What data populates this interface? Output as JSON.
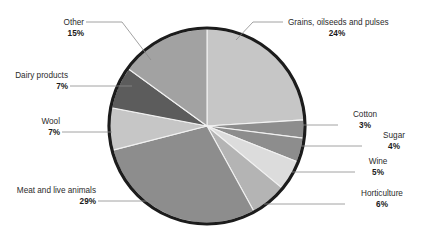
{
  "chart_data": {
    "type": "pie",
    "title": "",
    "subtitle": "",
    "xlabel": "",
    "ylabel": "",
    "legend_position": "none",
    "grid": false,
    "unit": "%",
    "total": 100,
    "start_angle_deg": 0,
    "direction": "clockwise",
    "categories": [
      "Grains, oilseeds and pulses",
      "Cotton",
      "Sugar",
      "Wine",
      "Horticulture",
      "Meat and live animals",
      "Wool",
      "Dairy products",
      "Other"
    ],
    "values": [
      24,
      3,
      4,
      5,
      6,
      29,
      7,
      7,
      15
    ],
    "slices": [
      {
        "label": "Grains, oilseeds and pulses",
        "value": 24,
        "value_text": "24%",
        "color": "#c6c6c6",
        "label_side": "right"
      },
      {
        "label": "Cotton",
        "value": 3,
        "value_text": "3%",
        "color": "#8d8d8d",
        "label_side": "right"
      },
      {
        "label": "Sugar",
        "value": 4,
        "value_text": "4%",
        "color": "#8d8d8d",
        "label_side": "right"
      },
      {
        "label": "Wine",
        "value": 5,
        "value_text": "5%",
        "color": "#dcdcdc",
        "label_side": "right"
      },
      {
        "label": "Horticulture",
        "value": 6,
        "value_text": "6%",
        "color": "#b4b4b4",
        "label_side": "right"
      },
      {
        "label": "Meat and live animals",
        "value": 29,
        "value_text": "29%",
        "color": "#8d8d8d",
        "label_side": "left"
      },
      {
        "label": "Wool",
        "value": 7,
        "value_text": "7%",
        "color": "#c6c6c6",
        "label_side": "left"
      },
      {
        "label": "Dairy products",
        "value": 7,
        "value_text": "7%",
        "color": "#5c5c5c",
        "label_side": "left"
      },
      {
        "label": "Other",
        "value": 15,
        "value_text": "15%",
        "color": "#a2a2a2",
        "label_side": "left"
      }
    ]
  },
  "labels": {
    "other": {
      "name": "Other",
      "pct": "15%"
    },
    "grains": {
      "name": "Grains, oilseeds and pulses",
      "pct": "24%"
    },
    "dairy": {
      "name": "Dairy products",
      "pct": "7%"
    },
    "wool": {
      "name": "Wool",
      "pct": "7%"
    },
    "meat": {
      "name": "Meat and live animals",
      "pct": "29%"
    },
    "cotton": {
      "name": "Cotton",
      "pct": "3%"
    },
    "sugar": {
      "name": "Sugar",
      "pct": "4%"
    },
    "wine": {
      "name": "Wine",
      "pct": "5%"
    },
    "horticulture": {
      "name": "Horticulture",
      "pct": "6%"
    }
  },
  "colors": {
    "background": "#ffffff",
    "outline": "#1c1c1c",
    "leader_line": "#8a8a8a",
    "text": "#2b2b2b"
  }
}
